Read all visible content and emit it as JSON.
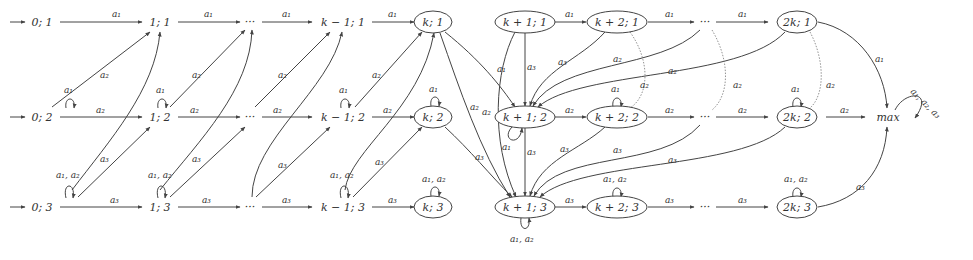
{
  "diagram": {
    "type": "automaton",
    "nodes": [
      {
        "id": "n01",
        "label": "0; 1",
        "x": 42,
        "y": 22,
        "circled": false,
        "initial": true
      },
      {
        "id": "n02",
        "label": "0; 2",
        "x": 42,
        "y": 117,
        "circled": false,
        "initial": true
      },
      {
        "id": "n03",
        "label": "0; 3",
        "x": 42,
        "y": 207,
        "circled": false,
        "initial": true
      },
      {
        "id": "n11",
        "label": "1; 1",
        "x": 160,
        "y": 22,
        "circled": false
      },
      {
        "id": "n12",
        "label": "1; 2",
        "x": 160,
        "y": 117,
        "circled": false
      },
      {
        "id": "n13",
        "label": "1; 3",
        "x": 160,
        "y": 207,
        "circled": false
      },
      {
        "id": "nd1",
        "label": "···",
        "x": 250,
        "y": 22,
        "circled": false
      },
      {
        "id": "nd2",
        "label": "···",
        "x": 250,
        "y": 117,
        "circled": false
      },
      {
        "id": "nd3",
        "label": "···",
        "x": 250,
        "y": 207,
        "circled": false
      },
      {
        "id": "nkm11",
        "label": "k − 1; 1",
        "x": 343,
        "y": 22,
        "circled": false
      },
      {
        "id": "nkm12",
        "label": "k − 1; 2",
        "x": 343,
        "y": 117,
        "circled": false
      },
      {
        "id": "nkm13",
        "label": "k − 1; 3",
        "x": 343,
        "y": 207,
        "circled": false
      },
      {
        "id": "nk1",
        "label": "k; 1",
        "x": 433,
        "y": 22,
        "circled": true
      },
      {
        "id": "nk2",
        "label": "k; 2",
        "x": 433,
        "y": 117,
        "circled": true
      },
      {
        "id": "nk3",
        "label": "k; 3",
        "x": 433,
        "y": 207,
        "circled": true
      },
      {
        "id": "nkp11",
        "label": "k + 1; 1",
        "x": 525,
        "y": 22,
        "circled": true
      },
      {
        "id": "nkp12",
        "label": "k + 1; 2",
        "x": 525,
        "y": 117,
        "circled": true
      },
      {
        "id": "nkp13",
        "label": "k + 1; 3",
        "x": 525,
        "y": 207,
        "circled": true
      },
      {
        "id": "nkp21",
        "label": "k + 2; 1",
        "x": 617,
        "y": 22,
        "circled": true
      },
      {
        "id": "nkp22",
        "label": "k + 2; 2",
        "x": 617,
        "y": 117,
        "circled": true
      },
      {
        "id": "nkp23",
        "label": "k + 2; 3",
        "x": 617,
        "y": 207,
        "circled": true
      },
      {
        "id": "nd21",
        "label": "···",
        "x": 705,
        "y": 22,
        "circled": false
      },
      {
        "id": "nd22",
        "label": "···",
        "x": 705,
        "y": 117,
        "circled": false
      },
      {
        "id": "nd23",
        "label": "···",
        "x": 705,
        "y": 207,
        "circled": false
      },
      {
        "id": "n2k1",
        "label": "2k; 1",
        "x": 797,
        "y": 22,
        "circled": true
      },
      {
        "id": "n2k2",
        "label": "2k; 2",
        "x": 797,
        "y": 117,
        "circled": true
      },
      {
        "id": "n2k3",
        "label": "2k; 3",
        "x": 797,
        "y": 207,
        "circled": true
      },
      {
        "id": "nmax",
        "label": "max",
        "x": 888,
        "y": 117,
        "circled": false
      }
    ],
    "edge_labels": {
      "a1": "a₁",
      "a2": "a₂",
      "a3": "a₃",
      "a1a2": "a₁, a₂",
      "a1a2a3": "a₁, a₂, a₃"
    }
  }
}
